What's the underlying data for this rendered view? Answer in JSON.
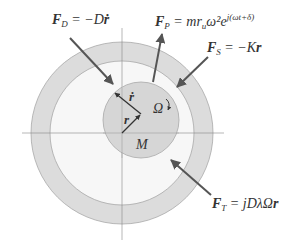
{
  "diagram": {
    "labels": {
      "damping_force": {
        "sym": "F",
        "sub": "D",
        "eq": " = −D",
        "vec": "ṙ"
      },
      "unbalance_force": {
        "sym": "F",
        "sub": "P",
        "eq": " = mr",
        "sub2": "u",
        "mid": "ω²e",
        "sup": "j(ωt+δ)"
      },
      "spring_force": {
        "sym": "F",
        "sub": "S",
        "eq": " = −K",
        "vec": "r"
      },
      "tangential_force": {
        "sym": "F",
        "sub": "T",
        "eq": " = jDλΩ",
        "vec": "r"
      },
      "velocity_vec": "ṙ",
      "position_vec": "r",
      "rotation": "Ω",
      "mass": "M"
    },
    "colors": {
      "outer_ring": "#dcdcdc",
      "inner_fill": "#f7f7f7",
      "mass_disk": "#d6d6d6",
      "arrow": "#555555",
      "axis": "#888888"
    }
  }
}
